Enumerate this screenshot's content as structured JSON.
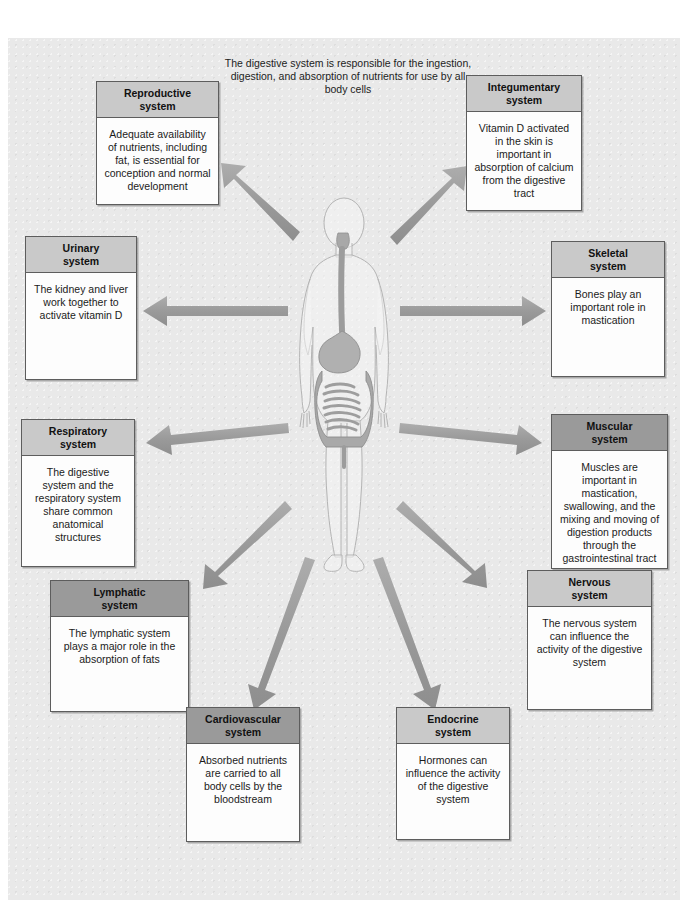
{
  "page": {
    "intro": "The digestive system is responsible for the ingestion, digestion, and absorption of nutrients for use by all body cells",
    "center_figure_label": "human body with digestive system"
  },
  "colors": {
    "paper": "#e9e9e9",
    "box_fill": "#fdfdfd",
    "header_light": "#c9c9c9",
    "header_dark": "#9a9a9a",
    "border": "#5d5d5d",
    "arrow": "#9b9b9b",
    "text": "#1b1b1b"
  },
  "systems": [
    {
      "key": "reproductive",
      "title": "Reproductive\nsystem",
      "title_line1": "Reproductive",
      "title_line2": "system",
      "body": "Adequate availability of nutrients, including fat, is essential for conception and normal development",
      "header_shade": "light"
    },
    {
      "key": "integumentary",
      "title_line1": "Integumentary",
      "title_line2": "system",
      "body": "Vitamin D activated in the skin is important in absorption of calcium from the digestive tract",
      "header_shade": "light"
    },
    {
      "key": "urinary",
      "title_line1": "Urinary",
      "title_line2": "system",
      "body": "The kidney and liver work together to activate vitamin D",
      "header_shade": "light"
    },
    {
      "key": "skeletal",
      "title_line1": "Skeletal",
      "title_line2": "system",
      "body": "Bones play an important role in mastication",
      "header_shade": "light"
    },
    {
      "key": "respiratory",
      "title_line1": "Respiratory",
      "title_line2": "system",
      "body": "The digestive system and the respiratory system share common anatomical structures",
      "header_shade": "light"
    },
    {
      "key": "muscular",
      "title_line1": "Muscular",
      "title_line2": "system",
      "body": "Muscles are important in mastication, swallowing, and the mixing and moving of digestion products through the gastrointestinal tract",
      "header_shade": "dark"
    },
    {
      "key": "lymphatic",
      "title_line1": "Lymphatic",
      "title_line2": "system",
      "body": "The lymphatic system plays a major role in the absorption of fats",
      "header_shade": "dark"
    },
    {
      "key": "nervous",
      "title_line1": "Nervous",
      "title_line2": "system",
      "body": "The nervous system can influence the activity of the digestive system",
      "header_shade": "light"
    },
    {
      "key": "cardiovascular",
      "title_line1": "Cardiovascular",
      "title_line2": "system",
      "body": "Absorbed nutrients are carried to all body cells by the bloodstream",
      "header_shade": "dark"
    },
    {
      "key": "endocrine",
      "title_line1": "Endocrine",
      "title_line2": "system",
      "body": "Hormones can influence the activity of the digestive system",
      "header_shade": "light"
    }
  ],
  "arrows": [
    {
      "from": "center",
      "to": "reproductive",
      "direction": "up-left"
    },
    {
      "from": "center",
      "to": "integumentary",
      "direction": "up-right"
    },
    {
      "from": "center",
      "to": "urinary",
      "direction": "left"
    },
    {
      "from": "center",
      "to": "skeletal",
      "direction": "right"
    },
    {
      "from": "center",
      "to": "respiratory",
      "direction": "left"
    },
    {
      "from": "center",
      "to": "muscular",
      "direction": "right"
    },
    {
      "from": "center",
      "to": "lymphatic",
      "direction": "down-left"
    },
    {
      "from": "center",
      "to": "nervous",
      "direction": "down-right"
    },
    {
      "from": "center",
      "to": "cardiovascular",
      "direction": "down-left"
    },
    {
      "from": "center",
      "to": "endocrine",
      "direction": "down-right"
    }
  ]
}
